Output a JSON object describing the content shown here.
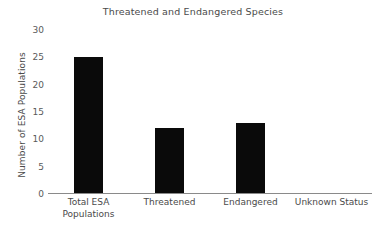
{
  "chart_data": {
    "type": "bar",
    "title": "Threatened and Endangered Species",
    "xlabel": "",
    "ylabel": "Number of ESA Populations",
    "categories": [
      "Total ESA\nPopulations",
      "Threatened",
      "Endangered",
      "Unknown Status"
    ],
    "values": [
      25,
      12,
      13,
      0
    ],
    "ylim": [
      0,
      30
    ],
    "yticks": [
      0,
      5,
      10,
      15,
      20,
      25,
      30
    ],
    "ytick_labels": [
      "0",
      "5",
      "10",
      "15",
      "20",
      "25",
      "30"
    ],
    "grid": false,
    "legend": false,
    "bar_color": "#0a0a0a",
    "axis_color": "#8a8a8a",
    "text_color": "#4a4a4a",
    "background": "#ffffff"
  }
}
